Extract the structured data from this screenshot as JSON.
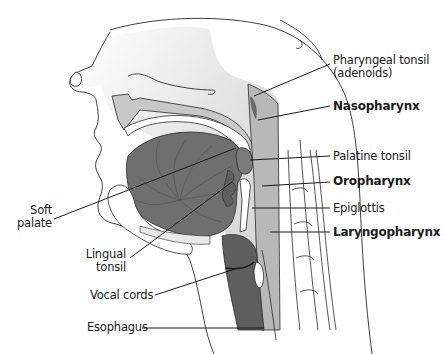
{
  "diagram": {
    "colors": {
      "background": "#ffffff",
      "outline": "#2a2a2a",
      "head_fill_light": "#f2f2f2",
      "head_fill_mid": "#d6d6d6",
      "pharynx_fill": "#bdbdbd",
      "tongue_fill": "#6f6f6f",
      "tonsil_fill": "#7a7a7a",
      "airway_dark": "#5e5e5e",
      "leader_line": "#1a1a1a"
    },
    "labels": [
      {
        "id": "pharyngeal-tonsil",
        "text": "Pharyngeal tonsil",
        "bold": false,
        "side": "right"
      },
      {
        "id": "pharyngeal-tonsil-sub",
        "text": "(adenoids)",
        "bold": false,
        "side": "right"
      },
      {
        "id": "nasopharynx",
        "text": "Nasopharynx",
        "bold": true,
        "side": "right"
      },
      {
        "id": "palatine-tonsil",
        "text": "Palatine tonsil",
        "bold": false,
        "side": "right"
      },
      {
        "id": "oropharynx",
        "text": "Oropharynx",
        "bold": true,
        "side": "right"
      },
      {
        "id": "epiglottis",
        "text": "Epiglottis",
        "bold": false,
        "side": "right"
      },
      {
        "id": "laryngopharynx",
        "text": "Laryngopharynx",
        "bold": true,
        "side": "right"
      },
      {
        "id": "soft-palate-1",
        "text": "Soft",
        "bold": false,
        "side": "left"
      },
      {
        "id": "soft-palate-2",
        "text": "palate",
        "bold": false,
        "side": "left"
      },
      {
        "id": "lingual-tonsil-1",
        "text": "Lingual",
        "bold": false,
        "side": "left"
      },
      {
        "id": "lingual-tonsil-2",
        "text": "tonsil",
        "bold": false,
        "side": "left"
      },
      {
        "id": "vocal-cords",
        "text": "Vocal cords",
        "bold": false,
        "side": "left"
      },
      {
        "id": "esophagus",
        "text": "Esophagus",
        "bold": false,
        "side": "left"
      }
    ]
  }
}
